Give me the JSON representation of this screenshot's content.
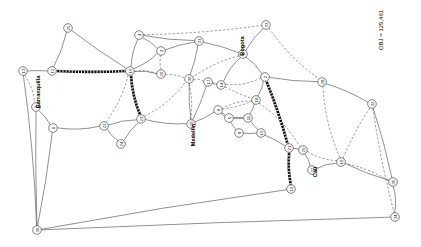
{
  "figure": {
    "objective_label": "OBJ = 125,461",
    "type": "network-graph"
  },
  "cities": [
    {
      "name": "Barranquilla",
      "x": 38,
      "y": 92,
      "rotation": -90
    },
    {
      "name": "Medellin",
      "x": 193,
      "y": 135,
      "rotation": -90
    },
    {
      "name": "Bogota",
      "x": 242,
      "y": 46,
      "rotation": -90
    },
    {
      "name": "Cali",
      "x": 315,
      "y": 172,
      "rotation": -90
    }
  ],
  "chart_data": {
    "type": "network",
    "title": "OBJ = 125,461",
    "nodes": [
      {
        "id": "13",
        "label": "13",
        "x": 23,
        "y": 71
      },
      {
        "id": "7",
        "label": "7",
        "x": 36,
        "y": 107
      },
      {
        "id": "6",
        "label": "6",
        "x": 53,
        "y": 128
      },
      {
        "id": "12",
        "label": "12",
        "x": 52,
        "y": 71
      },
      {
        "id": "25",
        "label": "25",
        "x": 68,
        "y": 28
      },
      {
        "id": "22",
        "label": "22",
        "x": 104,
        "y": 126
      },
      {
        "id": "24",
        "label": "24",
        "x": 121,
        "y": 144
      },
      {
        "id": "23",
        "label": "23",
        "x": 141,
        "y": 119
      },
      {
        "id": "10",
        "label": "10",
        "x": 130,
        "y": 71
      },
      {
        "id": "4",
        "label": "4",
        "x": 139,
        "y": 35
      },
      {
        "id": "3",
        "label": "3",
        "x": 161,
        "y": 51
      },
      {
        "id": "26",
        "label": "26",
        "x": 161,
        "y": 74
      },
      {
        "id": "31",
        "label": "31",
        "x": 199,
        "y": 41
      },
      {
        "id": "30",
        "label": "30",
        "x": 189,
        "y": 79
      },
      {
        "id": "29",
        "label": "29",
        "x": 191,
        "y": 124
      },
      {
        "id": "17",
        "label": "17",
        "x": 208,
        "y": 82
      },
      {
        "id": "14",
        "label": "14",
        "x": 221,
        "y": 85
      },
      {
        "id": "1",
        "label": "1",
        "x": 243,
        "y": 54
      },
      {
        "id": "33",
        "label": "33",
        "x": 266,
        "y": 25
      },
      {
        "id": "2",
        "label": "2",
        "x": 265,
        "y": 77
      },
      {
        "id": "18",
        "label": "18",
        "x": 256,
        "y": 100
      },
      {
        "id": "9",
        "label": "9",
        "x": 218,
        "y": 110
      },
      {
        "id": "5",
        "label": "5",
        "x": 229,
        "y": 118
      },
      {
        "id": "11",
        "label": "11",
        "x": 248,
        "y": 118
      },
      {
        "id": "8",
        "label": "8",
        "x": 239,
        "y": 133
      },
      {
        "id": "15",
        "label": "15",
        "x": 261,
        "y": 133
      },
      {
        "id": "21",
        "label": "21",
        "x": 289,
        "y": 148
      },
      {
        "id": "20",
        "label": "20",
        "x": 303,
        "y": 150
      },
      {
        "id": "27",
        "label": "27",
        "x": 312,
        "y": 170
      },
      {
        "id": "19",
        "label": "19",
        "x": 341,
        "y": 162
      },
      {
        "id": "16",
        "label": "16",
        "x": 291,
        "y": 189
      },
      {
        "id": "28",
        "label": "28",
        "x": 322,
        "y": 82
      },
      {
        "id": "32",
        "label": "32",
        "x": 372,
        "y": 104
      },
      {
        "id": "35",
        "label": "35",
        "x": 393,
        "y": 182
      },
      {
        "id": "34",
        "label": "34",
        "x": 395,
        "y": 217
      },
      {
        "id": "36",
        "label": "36",
        "x": 37,
        "y": 230
      }
    ],
    "edges_solid": [
      [
        "13",
        "12"
      ],
      [
        "13",
        "36"
      ],
      [
        "12",
        "25"
      ],
      [
        "25",
        "10"
      ],
      [
        "7",
        "6"
      ],
      [
        "7",
        "36"
      ],
      [
        "6",
        "22"
      ],
      [
        "6",
        "36"
      ],
      [
        "22",
        "24"
      ],
      [
        "22",
        "23"
      ],
      [
        "24",
        "23"
      ],
      [
        "23",
        "29"
      ],
      [
        "10",
        "4"
      ],
      [
        "10",
        "3"
      ],
      [
        "10",
        "26"
      ],
      [
        "10",
        "23"
      ],
      [
        "4",
        "3"
      ],
      [
        "4",
        "31"
      ],
      [
        "3",
        "31"
      ],
      [
        "31",
        "1"
      ],
      [
        "31",
        "30"
      ],
      [
        "30",
        "29"
      ],
      [
        "29",
        "9"
      ],
      [
        "1",
        "2"
      ],
      [
        "1",
        "33"
      ],
      [
        "1",
        "14"
      ],
      [
        "14",
        "17"
      ],
      [
        "17",
        "29"
      ],
      [
        "2",
        "18"
      ],
      [
        "18",
        "11"
      ],
      [
        "11",
        "5"
      ],
      [
        "5",
        "9"
      ],
      [
        "9",
        "8"
      ],
      [
        "8",
        "15"
      ],
      [
        "15",
        "21"
      ],
      [
        "21",
        "20"
      ],
      [
        "20",
        "27"
      ],
      [
        "27",
        "19"
      ],
      [
        "21",
        "16"
      ],
      [
        "16",
        "36"
      ],
      [
        "2",
        "28"
      ],
      [
        "28",
        "32"
      ],
      [
        "32",
        "35"
      ],
      [
        "35",
        "34"
      ],
      [
        "34",
        "36"
      ],
      [
        "19",
        "35"
      ],
      [
        "11",
        "15"
      ],
      [
        "5",
        "11"
      ]
    ],
    "edges_dashed": [
      [
        "13",
        "7"
      ],
      [
        "12",
        "10"
      ],
      [
        "4",
        "33"
      ],
      [
        "26",
        "30"
      ],
      [
        "10",
        "22"
      ],
      [
        "10",
        "26"
      ],
      [
        "23",
        "30"
      ],
      [
        "30",
        "17"
      ],
      [
        "17",
        "14"
      ],
      [
        "14",
        "18"
      ],
      [
        "18",
        "9"
      ],
      [
        "2",
        "14"
      ],
      [
        "33",
        "28"
      ],
      [
        "28",
        "19"
      ],
      [
        "32",
        "34"
      ],
      [
        "35",
        "19"
      ],
      [
        "18",
        "20"
      ],
      [
        "1",
        "30"
      ],
      [
        "26",
        "3"
      ],
      [
        "9",
        "18"
      ],
      [
        "29",
        "30"
      ],
      [
        "19",
        "32"
      ],
      [
        "20",
        "19"
      ],
      [
        "2",
        "21"
      ]
    ],
    "edges_highlighted": [
      [
        "12",
        "10"
      ],
      [
        "10",
        "23"
      ],
      [
        "2",
        "21"
      ],
      [
        "21",
        "16"
      ]
    ]
  }
}
